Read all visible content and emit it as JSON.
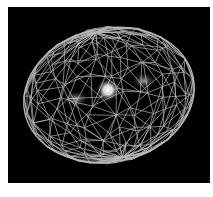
{
  "figure": {
    "colors": {
      "background": "#000000",
      "margin": "#ffffff",
      "wireframe": "#d8d8d8",
      "core_glow": "#ffffff",
      "lobes": "#8a8a8a"
    },
    "ellipsoid": {
      "cx": 101,
      "cy": 88,
      "rx": 86,
      "ry": 68,
      "rotation_deg": -12
    },
    "core": {
      "cx": 100,
      "cy": 83,
      "r": 8
    },
    "lobes": [
      {
        "cx": 68,
        "cy": 92,
        "rx": 12,
        "ry": 8
      },
      {
        "cx": 136,
        "cy": 74,
        "rx": 12,
        "ry": 8
      }
    ]
  }
}
